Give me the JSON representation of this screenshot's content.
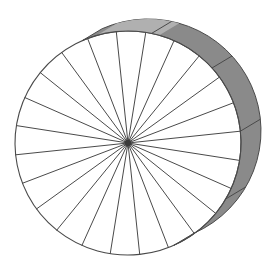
{
  "figure": {
    "title": "Spoked wheel in oblique perspective",
    "subject": "wheel",
    "background_color": "#ffffff",
    "canvas": {
      "width": 276,
      "height": 267
    }
  },
  "colors": {
    "background": "#ffffff",
    "outline": "#4a4a4a",
    "spoke": "#4a4a4a",
    "rim_band_fill": "#8a8a8a",
    "rim_band_highlight": "#b0b0b0",
    "rim_band_shadow": "#7d7d7d",
    "hub_fill": "#3a3a3a"
  },
  "geometry": {
    "front_face": {
      "label": "front rim circle",
      "center_x": 128,
      "center_y": 143,
      "radius_x": 113,
      "radius_y": 112,
      "rotation_deg": -6,
      "stroke_width": 1.1
    },
    "back_face": {
      "label": "back rim circle",
      "center_x": 148,
      "center_y": 131,
      "radius_x": 113,
      "radius_y": 112,
      "rotation_deg": -6,
      "stroke_width": 1.1
    },
    "depth_offset": {
      "dx": 20,
      "dy": -12
    },
    "hub": {
      "label": "hub",
      "center_x": 128,
      "center_y": 143,
      "radius": 3.2
    },
    "spokes": {
      "label": "radial spokes",
      "count": 24,
      "angle_step_deg": 15,
      "start_angle_deg": 0,
      "stroke_width": 1.0
    },
    "rim_band": {
      "label": "wheel rim thickness band",
      "visible_arc_start_deg": -108,
      "visible_arc_end_deg": 72,
      "divider_angles_deg": [
        -72,
        -36,
        0,
        36
      ],
      "highlight_arc_start_deg": -100,
      "highlight_arc_end_deg": -68
    }
  },
  "chart_data": {
    "type": "diagram",
    "title": "Spoked wheel in oblique perspective",
    "elements": [
      {
        "name": "front rim circle",
        "kind": "ellipse",
        "count": 1
      },
      {
        "name": "radial spokes",
        "kind": "line",
        "count": 24,
        "angular_spacing_deg": 15
      },
      {
        "name": "hub",
        "kind": "dot",
        "count": 1
      },
      {
        "name": "rim thickness band",
        "kind": "swept-arc",
        "count": 1
      },
      {
        "name": "rim band divider lines",
        "kind": "line",
        "count": 4
      },
      {
        "name": "rim highlight patch",
        "kind": "swept-arc",
        "count": 1
      }
    ]
  }
}
